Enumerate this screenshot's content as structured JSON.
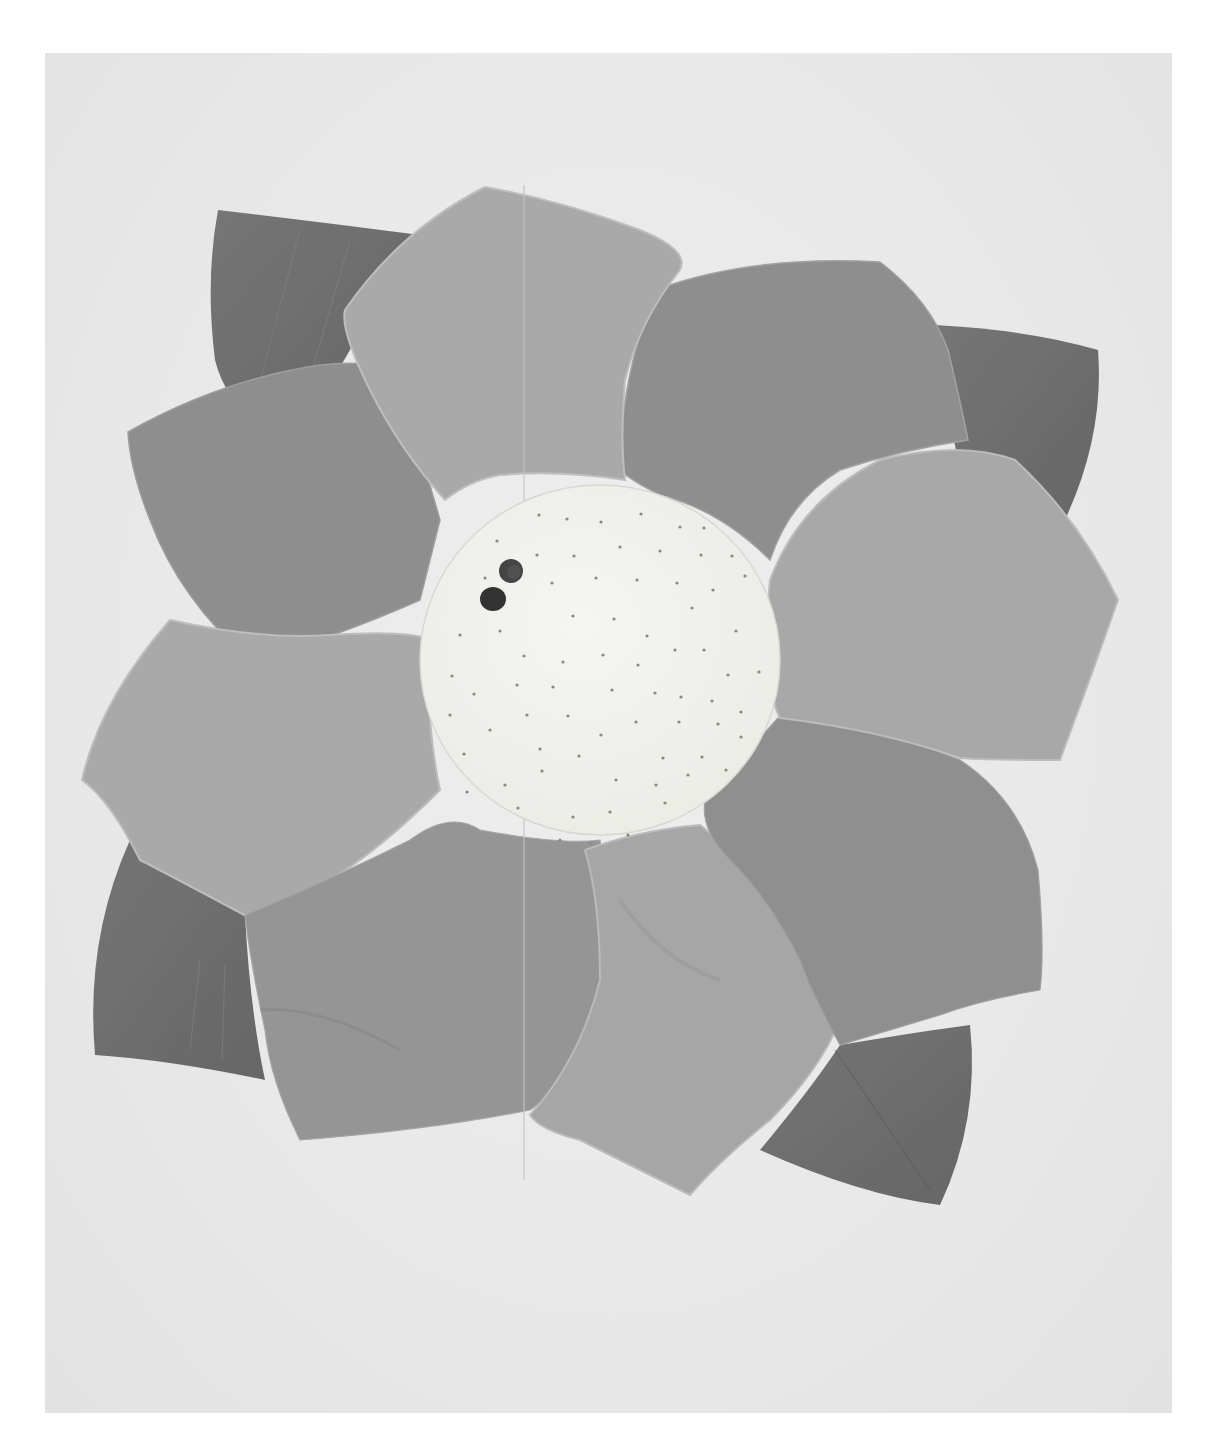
{
  "image": {
    "subject": "fabric flower mat",
    "description": "Grayscale photo of a quilted fabric flower with layered petals, four dark leaves, and a pale spotted circular center with two small dark marks",
    "colors": {
      "page_background": "#ffffff",
      "photo_background": "#ebebeb",
      "leaf": "#6f6f6f",
      "petal_dark": "#8c8c8c",
      "petal_mid": "#9a9a9a",
      "petal_light": "#aaaaaa",
      "petal_outline": "#bdbdbd",
      "center": "#f0f0ec",
      "center_dots": "#8a8a80",
      "center_marks": "#3a3a3a"
    },
    "parts": {
      "leaves": [
        "top-left-leaf",
        "top-right-leaf",
        "bottom-left-leaf",
        "bottom-right-leaf"
      ],
      "petals": [
        "top-petal",
        "top-right-petal",
        "right-petal",
        "lower-right-petal",
        "bottom-petal",
        "bottom-left-petal",
        "left-petal",
        "upper-left-petal"
      ],
      "center": "spotted-center",
      "marks_count": 2
    }
  }
}
